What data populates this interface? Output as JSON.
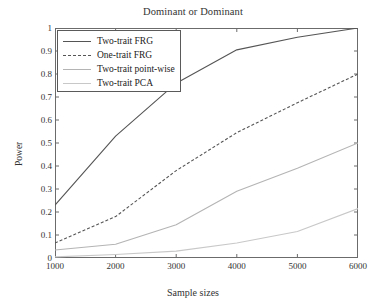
{
  "chart_data": {
    "type": "line",
    "title": "Dominant or Dominant",
    "xlabel": "Sample sizes",
    "ylabel": "Power",
    "x": [
      1000,
      2000,
      3000,
      4000,
      5000,
      6000
    ],
    "xlim": [
      1000,
      6000
    ],
    "ylim": [
      0,
      1
    ],
    "xticks": [
      1000,
      2000,
      3000,
      4000,
      5000,
      6000
    ],
    "yticks": [
      0,
      0.1,
      0.2,
      0.3,
      0.4,
      0.5,
      0.6,
      0.7,
      0.8,
      0.9,
      1
    ],
    "xtick_labels": [
      "1000",
      "2000",
      "3000",
      "4000",
      "5000",
      "6000"
    ],
    "ytick_labels": [
      "0",
      "0.1",
      "0.2",
      "0.3",
      "0.4",
      "0.5",
      "0.6",
      "0.7",
      "0.8",
      "0.9",
      "1"
    ],
    "grid": false,
    "legend_position": "upper-left",
    "series": [
      {
        "name": "Two-trait FRG",
        "values": [
          0.23,
          0.53,
          0.76,
          0.905,
          0.96,
          1.0
        ],
        "color": "#555555",
        "style": "solid"
      },
      {
        "name": "One-trait FRG",
        "values": [
          0.065,
          0.18,
          0.38,
          0.545,
          0.675,
          0.8
        ],
        "color": "#555555",
        "style": "dashed"
      },
      {
        "name": "Two-trait point-wise",
        "values": [
          0.035,
          0.06,
          0.145,
          0.29,
          0.39,
          0.5
        ],
        "color": "#b4b4b4",
        "style": "solid"
      },
      {
        "name": "Two-trait PCA",
        "values": [
          0.005,
          0.015,
          0.03,
          0.065,
          0.115,
          0.215
        ],
        "color": "#c8c8c8",
        "style": "solid"
      }
    ]
  },
  "axes": {
    "frame_color": "#6b6b6b"
  }
}
